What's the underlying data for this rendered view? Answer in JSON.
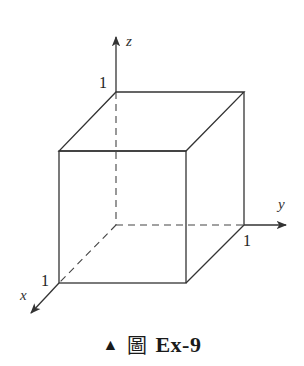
{
  "figure": {
    "type": "unit cube in 3D coordinate axes",
    "axes": {
      "x": {
        "label": "x",
        "tick": "1"
      },
      "y": {
        "label": "y",
        "tick": "1"
      },
      "z": {
        "label": "z",
        "tick": "1"
      }
    },
    "colors": {
      "line": "#333333",
      "background": "#ffffff"
    }
  },
  "caption": {
    "marker": "▲",
    "prefix": "圖",
    "id": "Ex-9"
  }
}
